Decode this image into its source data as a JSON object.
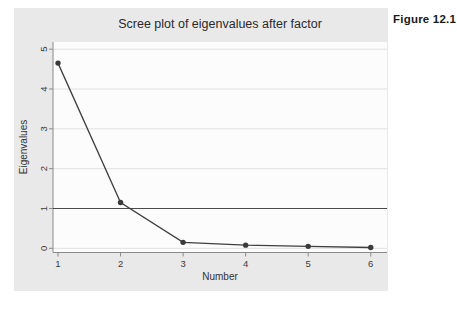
{
  "figure_label": "Figure 12.1",
  "chart_data": {
    "type": "line",
    "title": "Scree plot of eigenvalues after factor",
    "xlabel": "Number",
    "ylabel": "Eigenvalues",
    "x": [
      1,
      2,
      3,
      4,
      5,
      6
    ],
    "series": [
      {
        "name": "Eigenvalues",
        "values": [
          4.65,
          1.15,
          0.15,
          0.08,
          0.05,
          0.02
        ]
      }
    ],
    "xticks": [
      1,
      2,
      3,
      4,
      5,
      6
    ],
    "yticks": [
      0,
      1,
      2,
      3,
      4,
      5
    ],
    "xlim": [
      1,
      6
    ],
    "ylim": [
      0,
      5
    ],
    "reference_line_y": 1,
    "grid": true,
    "legend": "none",
    "marker": "circle",
    "colors": {
      "line": "#3f3f3f",
      "marker": "#3a3a3a",
      "reference_line": "#4a4a4a",
      "grid": "#e0e0e0",
      "axis": "#8a8a8a",
      "tick_text": "#3a3a3a",
      "chart_background": "#e9e9e9",
      "plot_background": "#fcfcfc"
    }
  }
}
